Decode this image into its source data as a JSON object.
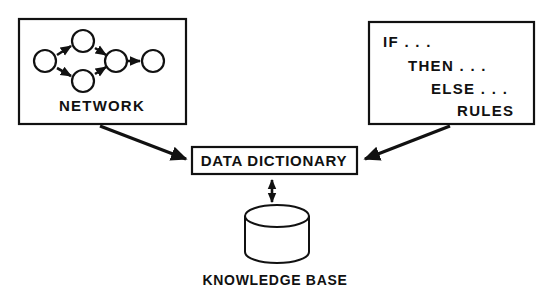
{
  "diagram": {
    "background_color": "#ffffff",
    "line_color": "#111111",
    "boxes": {
      "network": {
        "label": "NETWORK",
        "node_count": 5,
        "node_labels": [
          "",
          "",
          "",
          "",
          ""
        ]
      },
      "rules": {
        "lines": [
          "IF . . .",
          "THEN . . .",
          "ELSE . . .",
          "RULES"
        ]
      },
      "data_dictionary": {
        "label": "DATA DICTIONARY"
      },
      "knowledge_base": {
        "label": "KNOWLEDGE BASE",
        "shape": "cylinder-icon"
      }
    },
    "connectors": [
      {
        "name": "network-to-data-dictionary",
        "from": "network",
        "to": "data_dictionary",
        "direction": "one-way"
      },
      {
        "name": "rules-to-data-dictionary",
        "from": "rules",
        "to": "data_dictionary",
        "direction": "one-way"
      },
      {
        "name": "data-dictionary-to-knowledge-base",
        "from": "data_dictionary",
        "to": "knowledge_base",
        "direction": "two-way"
      }
    ]
  }
}
